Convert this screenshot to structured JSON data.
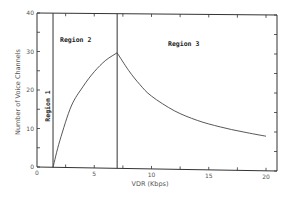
{
  "chart_data": {
    "type": "line",
    "title": "",
    "xlabel": "VDR (Kbps)",
    "ylabel": "Number of Voice Channels",
    "xlim": [
      0,
      21
    ],
    "ylim": [
      0,
      40
    ],
    "x_ticks": [
      "0",
      "5",
      "10",
      "15",
      "20"
    ],
    "y_ticks": [
      "0",
      "10",
      "20",
      "30",
      "40"
    ],
    "grid": false,
    "legend": null,
    "series": [
      {
        "name": "Voice channels",
        "x": [
          1.4,
          2,
          3,
          4,
          5,
          6,
          7,
          8,
          9,
          10,
          12,
          14,
          16,
          18,
          20
        ],
        "y": [
          0,
          7,
          16,
          21,
          25,
          28,
          30,
          25.5,
          21.8,
          18.9,
          15.2,
          12.8,
          11.2,
          10,
          9
        ]
      }
    ],
    "regions": [
      {
        "label": "Region 1",
        "x_start": 0,
        "x_end": 1.4
      },
      {
        "label": "Region 2",
        "x_start": 1.4,
        "x_end": 7
      },
      {
        "label": "Region 3",
        "x_start": 7,
        "x_end": 20
      }
    ],
    "vertical_lines_x": [
      1.4,
      7
    ]
  }
}
